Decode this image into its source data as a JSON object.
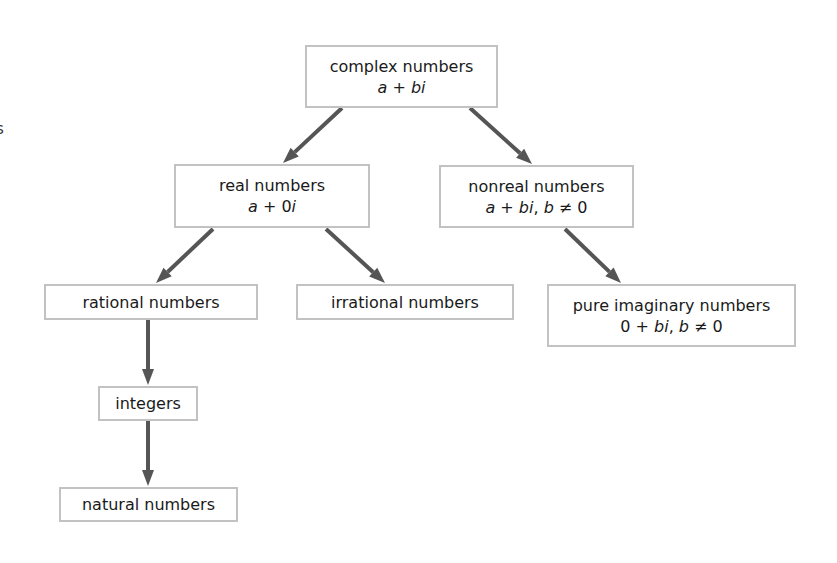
{
  "diagram": {
    "nodes": [
      {
        "id": "complex",
        "label": "complex numbers",
        "formula": "a + bi",
        "box": [
          305,
          45,
          193,
          63
        ]
      },
      {
        "id": "real",
        "label": "real numbers",
        "formula": "a + 0i",
        "box": [
          174,
          164,
          196,
          64
        ]
      },
      {
        "id": "nonreal",
        "label": "nonreal numbers",
        "formula": "a + bi, b ≠ 0",
        "box": [
          439,
          165,
          195,
          63
        ]
      },
      {
        "id": "rational",
        "label": "rational numbers",
        "formula": "",
        "box": [
          44,
          284,
          214,
          36
        ]
      },
      {
        "id": "irrational",
        "label": "irrational numbers",
        "formula": "",
        "box": [
          296,
          284,
          218,
          36
        ]
      },
      {
        "id": "pure_imaginary",
        "label": "pure imaginary numbers",
        "formula": "0 + bi, b ≠ 0",
        "box": [
          547,
          284,
          249,
          63
        ]
      },
      {
        "id": "integers",
        "label": "integers",
        "formula": "",
        "box": [
          98,
          386,
          100,
          35
        ]
      },
      {
        "id": "natural",
        "label": "natural numbers",
        "formula": "",
        "box": [
          59,
          487,
          179,
          35
        ]
      }
    ],
    "edges": [
      {
        "from": "complex",
        "to": "real",
        "points": [
          342,
          108,
          283,
          163
        ]
      },
      {
        "from": "complex",
        "to": "nonreal",
        "points": [
          470,
          108,
          532,
          164
        ]
      },
      {
        "from": "real",
        "to": "rational",
        "points": [
          213,
          229,
          156,
          283
        ]
      },
      {
        "from": "real",
        "to": "irrational",
        "points": [
          326,
          229,
          385,
          283
        ]
      },
      {
        "from": "nonreal",
        "to": "pure_imaginary",
        "points": [
          565,
          229,
          621,
          283
        ]
      },
      {
        "from": "rational",
        "to": "integers",
        "points": [
          148,
          320,
          148,
          385
        ]
      },
      {
        "from": "integers",
        "to": "natural",
        "points": [
          148,
          421,
          148,
          486
        ]
      }
    ],
    "colors": {
      "border": "#c2c2c2",
      "arrow": "#555555",
      "text": "#1a1a1a"
    },
    "edge_fragments": [
      ".",
      "s"
    ]
  }
}
